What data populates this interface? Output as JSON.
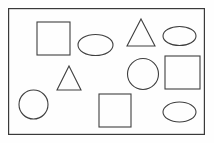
{
  "figure": {
    "background_color": "#fefefe",
    "width": 214,
    "height": 143
  },
  "frame": {
    "name": "outer-rectangle-border",
    "x": 8,
    "y": 8,
    "width": 197,
    "height": 127,
    "stroke_color": "#3a3a3a",
    "stroke_width": 1.2,
    "fill": "none"
  },
  "style": {
    "shape_stroke_color": "#3f3f3f",
    "shape_stroke_width": 1.1,
    "shape_fill": "none"
  },
  "counts": {
    "total": 11,
    "squares": 3,
    "triangles": 2,
    "circles": 2,
    "ellipses": 4
  },
  "shapes": [
    {
      "id": "square-top-left",
      "type": "square",
      "x": 37,
      "y": 22,
      "width": 33,
      "height": 33
    },
    {
      "id": "ellipse-upper-left-center",
      "type": "ellipse",
      "cx": 95.5,
      "cy": 45,
      "rx": 17.5,
      "ry": 10.5
    },
    {
      "id": "triangle-top-center",
      "type": "triangle",
      "x": 127,
      "y": 19,
      "width": 28,
      "height": 27
    },
    {
      "id": "ellipse-top-right",
      "type": "ellipse",
      "cx": 179.5,
      "cy": 36,
      "rx": 16.5,
      "ry": 9.5
    },
    {
      "id": "triangle-middle-left",
      "type": "triangle",
      "x": 57,
      "y": 66,
      "width": 24,
      "height": 24
    },
    {
      "id": "circle-middle-center",
      "type": "circle",
      "cx": 143,
      "cy": 74,
      "r": 15.5
    },
    {
      "id": "square-middle-right",
      "type": "square",
      "x": 165,
      "y": 56,
      "width": 35,
      "height": 33
    },
    {
      "id": "circle-bottom-left",
      "type": "circle",
      "cx": 33.5,
      "cy": 104.5,
      "r": 14.5
    },
    {
      "id": "square-bottom-center",
      "type": "square",
      "x": 99,
      "y": 94,
      "width": 32,
      "height": 33
    },
    {
      "id": "ellipse-bottom-right",
      "type": "ellipse",
      "cx": 179.5,
      "cy": 112,
      "rx": 16.5,
      "ry": 10
    }
  ]
}
